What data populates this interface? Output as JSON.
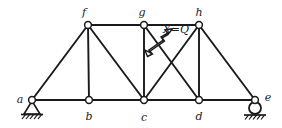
{
  "diagram": {
    "type": "truss-structural-diagram",
    "canvas": {
      "width": 282,
      "height": 128
    },
    "colors": {
      "member": "#1a1a1a",
      "node_fill": "#ffffff",
      "node_stroke": "#1a1a1a",
      "background": "#ffffff",
      "label": "#1a1a1a",
      "support": "#1a1a1a"
    },
    "nodes": [
      {
        "id": "a",
        "label": "a",
        "x": 32,
        "y": 100,
        "label_x": 20,
        "label_y": 97,
        "label_anchor": "middle"
      },
      {
        "id": "b",
        "label": "b",
        "x": 89,
        "y": 100,
        "label_x": 89,
        "label_y": 118,
        "label_anchor": "middle"
      },
      {
        "id": "c",
        "label": "c",
        "x": 144,
        "y": 100,
        "label_x": 144,
        "label_y": 119,
        "label_anchor": "middle"
      },
      {
        "id": "d",
        "label": "d",
        "x": 199,
        "y": 100,
        "label_x": 199,
        "label_y": 118,
        "label_anchor": "middle"
      },
      {
        "id": "e",
        "label": "e",
        "x": 255,
        "y": 100,
        "label_x": 269,
        "label_y": 97,
        "label_anchor": "middle"
      },
      {
        "id": "f",
        "label": "f",
        "x": 88,
        "y": 25,
        "label_x": 83,
        "label_y": 14,
        "label_anchor": "middle"
      },
      {
        "id": "g",
        "label": "g",
        "x": 144,
        "y": 25,
        "label_x": 142,
        "label_y": 14,
        "label_anchor": "middle"
      },
      {
        "id": "h",
        "label": "h",
        "x": 199,
        "y": 25,
        "label_x": 199,
        "label_y": 14,
        "label_anchor": "middle"
      }
    ],
    "members": [
      {
        "id": "a-b",
        "from": "a",
        "to": "b",
        "kind": "bottom-chord"
      },
      {
        "id": "b-c",
        "from": "b",
        "to": "c",
        "kind": "bottom-chord"
      },
      {
        "id": "c-d",
        "from": "c",
        "to": "d",
        "kind": "bottom-chord"
      },
      {
        "id": "d-e",
        "from": "d",
        "to": "e",
        "kind": "bottom-chord"
      },
      {
        "id": "f-g",
        "from": "f",
        "to": "g",
        "kind": "top-chord"
      },
      {
        "id": "g-h",
        "from": "g",
        "to": "h",
        "kind": "top-chord"
      },
      {
        "id": "a-f",
        "from": "a",
        "to": "f",
        "kind": "end-diagonal"
      },
      {
        "id": "h-e",
        "from": "h",
        "to": "e",
        "kind": "end-diagonal"
      },
      {
        "id": "f-b",
        "from": "f",
        "to": "b",
        "kind": "vertical"
      },
      {
        "id": "g-c",
        "from": "g",
        "to": "c",
        "kind": "vertical"
      },
      {
        "id": "h-d",
        "from": "h",
        "to": "d",
        "kind": "vertical"
      },
      {
        "id": "f-c",
        "from": "f",
        "to": "c",
        "kind": "diagonal"
      },
      {
        "id": "c-h",
        "from": "c",
        "to": "h",
        "kind": "diagonal-redundant"
      },
      {
        "id": "g-d",
        "from": "g",
        "to": "d",
        "kind": "diagonal"
      }
    ],
    "supports": [
      {
        "id": "support-a",
        "node": "a",
        "type": "pin",
        "label": "pinned-support"
      },
      {
        "id": "support-e",
        "node": "e",
        "type": "roller",
        "label": "roller-support"
      }
    ],
    "force_annotation": {
      "label": "X=Q",
      "label_x": 162,
      "label_y": 33,
      "member": "c-h",
      "arrow_type": "double-headed-open",
      "tail_x": 150,
      "tail_y": 53,
      "head_x": 175,
      "head_y": 31
    }
  }
}
